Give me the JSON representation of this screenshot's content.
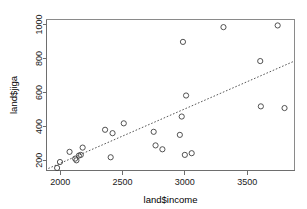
{
  "chart_data": {
    "type": "scatter",
    "title": "",
    "xlabel": "land$income",
    "ylabel": "land$jiga",
    "xlim": [
      1890,
      3880
    ],
    "ylim": [
      140,
      1030
    ],
    "xticks": [
      2000,
      2500,
      3000,
      3500
    ],
    "yticks": [
      200,
      400,
      600,
      800,
      1000
    ],
    "xtick_labels": [
      "2000",
      "2500",
      "3000",
      "3500"
    ],
    "ytick_labels": [
      "200",
      "400",
      "600",
      "800",
      "1000"
    ],
    "grid": false,
    "legend": "none",
    "point_marker": "open-circle",
    "points": [
      {
        "x": 1975,
        "y": 155
      },
      {
        "x": 1998,
        "y": 190
      },
      {
        "x": 2075,
        "y": 250
      },
      {
        "x": 2120,
        "y": 210
      },
      {
        "x": 2130,
        "y": 200
      },
      {
        "x": 2150,
        "y": 228
      },
      {
        "x": 2165,
        "y": 232
      },
      {
        "x": 2180,
        "y": 275
      },
      {
        "x": 2360,
        "y": 380
      },
      {
        "x": 2405,
        "y": 218
      },
      {
        "x": 2420,
        "y": 360
      },
      {
        "x": 2510,
        "y": 418
      },
      {
        "x": 2750,
        "y": 368
      },
      {
        "x": 2765,
        "y": 288
      },
      {
        "x": 2820,
        "y": 265
      },
      {
        "x": 2960,
        "y": 350
      },
      {
        "x": 2975,
        "y": 458
      },
      {
        "x": 2985,
        "y": 898
      },
      {
        "x": 3000,
        "y": 232
      },
      {
        "x": 3010,
        "y": 582
      },
      {
        "x": 3055,
        "y": 242
      },
      {
        "x": 3310,
        "y": 985
      },
      {
        "x": 3605,
        "y": 785
      },
      {
        "x": 3610,
        "y": 518
      },
      {
        "x": 3745,
        "y": 995
      },
      {
        "x": 3800,
        "y": 508
      }
    ],
    "fit_line": {
      "style": "dotted",
      "x_start": 1905,
      "y_start": 152,
      "x_end": 3870,
      "y_end": 782
    }
  }
}
